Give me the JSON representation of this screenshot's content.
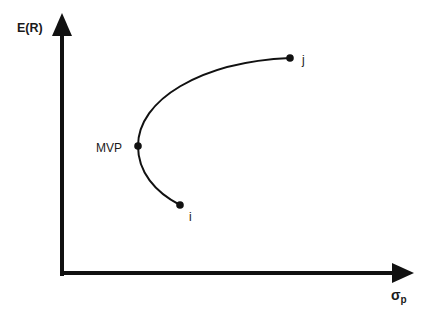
{
  "diagram": {
    "y_axis": {
      "label": "E(R)"
    },
    "x_axis": {
      "label_symbol": "σ",
      "label_subscript": "p"
    },
    "points": [
      {
        "id": "mvp",
        "label": "MVP"
      },
      {
        "id": "i",
        "label": "i"
      },
      {
        "id": "j",
        "label": "j"
      }
    ],
    "colors": {
      "ink": "#111111",
      "background": "#ffffff"
    }
  }
}
